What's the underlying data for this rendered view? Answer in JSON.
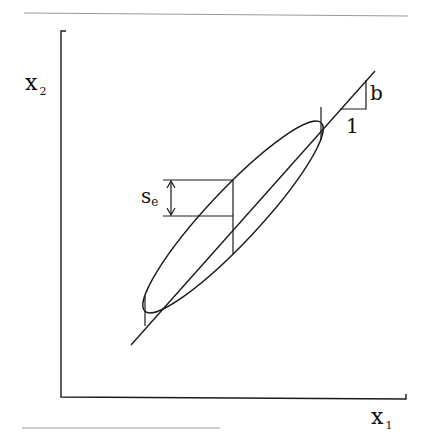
{
  "diagram": {
    "axes": {
      "x_label": "x",
      "x_subscript": "1",
      "y_label": "x",
      "y_subscript": "2"
    },
    "annotations": {
      "slope_rise": "b",
      "slope_run": "1",
      "se_label": "s",
      "se_subscript": "e"
    },
    "colors": {
      "stroke": "#1a1a1a",
      "rule": "#888888"
    }
  }
}
